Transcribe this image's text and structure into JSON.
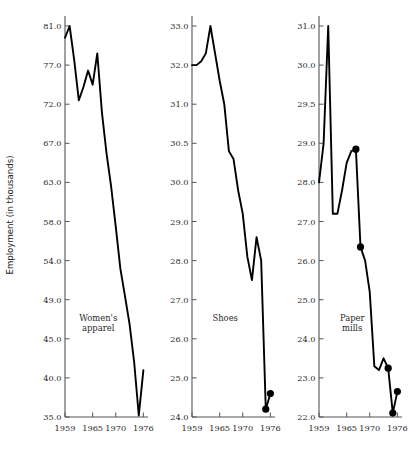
{
  "chart_data": {
    "type": "line",
    "title": "",
    "ylabel": "Employment (in thousands)",
    "xlabel": "",
    "grid": false,
    "legend": "none",
    "layout": "three side-by-side panels sharing a common y-axis label",
    "xlim": [
      1959,
      1977
    ],
    "xticks": [
      1959,
      1965,
      1970,
      1976
    ],
    "xticklabels": [
      "1959",
      "1965",
      "1970",
      "1976"
    ],
    "panels": [
      {
        "name": "Women's apparel",
        "label": "Women's\napparel",
        "label_line1": "Women's",
        "label_line2": "apparel",
        "yticklabels": [
          "81.0",
          "77.0",
          "72.0",
          "67.0",
          "63.0",
          "58.0",
          "54.0",
          "49.0",
          "45.0",
          "40.0",
          "35.0"
        ],
        "yticks": [
          81.0,
          77.0,
          72.0,
          67.0,
          63.0,
          58.0,
          54.0,
          49.0,
          45.0,
          40.0,
          35.0
        ],
        "ylim": [
          35.0,
          81.0
        ],
        "x": [
          1959,
          1960,
          1961,
          1962,
          1963,
          1964,
          1965,
          1966,
          1967,
          1968,
          1969,
          1970,
          1971,
          1972,
          1973,
          1974,
          1975,
          1976
        ],
        "y": [
          79.8,
          81.0,
          77.5,
          72.5,
          74.2,
          76.3,
          74.5,
          78.2,
          71.0,
          66.0,
          62.5,
          57.5,
          53.0,
          49.5,
          46.5,
          42.0,
          35.2,
          41.0
        ],
        "markers": []
      },
      {
        "name": "Shoes",
        "label": "Shoes",
        "label_line1": "Shoes",
        "label_line2": "",
        "yticklabels": [
          "33.0",
          "32.0",
          "31.0",
          "30.5",
          "30.0",
          "29.0",
          "28.0",
          "27.0",
          "26.0",
          "25.0",
          "24.0"
        ],
        "yticks": [
          33.0,
          32.0,
          31.0,
          30.5,
          30.0,
          29.0,
          28.0,
          27.0,
          26.0,
          25.0,
          24.0
        ],
        "ylim": [
          24.0,
          33.0
        ],
        "x": [
          1959,
          1960,
          1961,
          1962,
          1963,
          1964,
          1965,
          1966,
          1967,
          1968,
          1969,
          1970,
          1971,
          1972,
          1973,
          1974,
          1975,
          1976
        ],
        "y": [
          32.0,
          32.0,
          32.1,
          32.3,
          33.0,
          32.3,
          31.6,
          31.0,
          30.4,
          30.3,
          29.8,
          29.2,
          28.1,
          27.5,
          28.6,
          28.0,
          24.2,
          24.6
        ],
        "markers": [
          {
            "x": 1975,
            "y": 24.2
          },
          {
            "x": 1976,
            "y": 24.6
          }
        ]
      },
      {
        "name": "Paper mills",
        "label": "Paper\nmills",
        "label_line1": "Paper",
        "label_line2": "mills",
        "yticklabels": [
          "31.0",
          "30.0",
          "29.5",
          "29.0",
          "28.0",
          "27.0",
          "26.0",
          "25.0",
          "24.0",
          "23.0",
          "22.0"
        ],
        "yticks": [
          31.0,
          30.0,
          29.5,
          29.0,
          28.0,
          27.0,
          26.0,
          25.0,
          24.0,
          23.0,
          22.0
        ],
        "ylim": [
          22.0,
          31.0
        ],
        "x": [
          1959,
          1960,
          1961,
          1962,
          1963,
          1964,
          1965,
          1966,
          1967,
          1968,
          1969,
          1970,
          1971,
          1972,
          1973,
          1974,
          1975,
          1976
        ],
        "y": [
          28.0,
          29.0,
          31.0,
          27.2,
          27.2,
          27.8,
          28.5,
          28.8,
          28.85,
          26.35,
          26.0,
          25.2,
          23.3,
          23.2,
          23.5,
          23.25,
          22.1,
          22.65
        ],
        "markers": [
          {
            "x": 1967,
            "y": 28.85
          },
          {
            "x": 1968,
            "y": 26.35
          },
          {
            "x": 1974,
            "y": 23.25
          },
          {
            "x": 1975,
            "y": 22.1
          },
          {
            "x": 1976,
            "y": 22.65
          }
        ]
      }
    ]
  },
  "axis": {
    "ylabel": "Employment (in thousands)"
  },
  "colors": {
    "line": "#000000",
    "marker": "#000000",
    "axis": "#555555",
    "text": "#2a2a2a",
    "background": "#ffffff"
  }
}
